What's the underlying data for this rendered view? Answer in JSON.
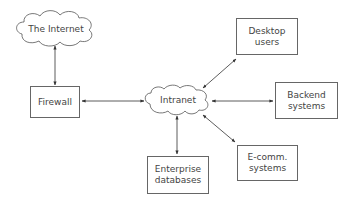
{
  "diagram": {
    "nodes": {
      "internet": {
        "label": "The Internet",
        "shape": "cloud"
      },
      "firewall": {
        "label": "Firewall",
        "shape": "box"
      },
      "intranet": {
        "label": "Intranet",
        "shape": "cloud"
      },
      "desktop": {
        "line1": "Desktop",
        "line2": "users",
        "shape": "box"
      },
      "backend": {
        "line1": "Backend",
        "line2": "systems",
        "shape": "box"
      },
      "ecomm": {
        "line1": "E-comm.",
        "line2": "systems",
        "shape": "box"
      },
      "enterprise": {
        "line1": "Enterprise",
        "line2": "databases",
        "shape": "box"
      }
    },
    "edges": [
      {
        "from": "The Internet",
        "to": "Firewall",
        "direction": "bidirectional"
      },
      {
        "from": "Firewall",
        "to": "Intranet",
        "direction": "bidirectional"
      },
      {
        "from": "Intranet",
        "to": "Desktop users",
        "direction": "bidirectional"
      },
      {
        "from": "Intranet",
        "to": "Backend systems",
        "direction": "bidirectional"
      },
      {
        "from": "Intranet",
        "to": "E-comm. systems",
        "direction": "bidirectional"
      },
      {
        "from": "Intranet",
        "to": "Enterprise databases",
        "direction": "bidirectional"
      }
    ],
    "colors": {
      "stroke": "#555555",
      "text": "#444444",
      "background": "#ffffff"
    }
  }
}
